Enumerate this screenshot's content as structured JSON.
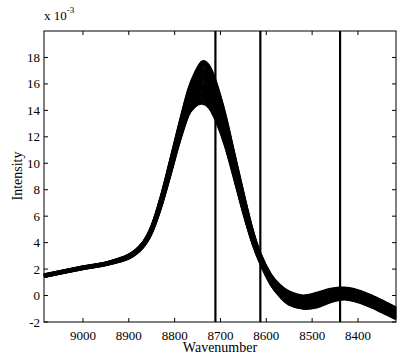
{
  "chart_data": {
    "type": "line",
    "title": "",
    "xlabel": "Wavenumber",
    "ylabel": "Intensity",
    "y_scale_label": "x 10",
    "y_scale_exponent": "-3",
    "xlim": [
      9085,
      8317
    ],
    "x_reversed": true,
    "ylim": [
      -2,
      20
    ],
    "grid": false,
    "legend": null,
    "x_ticks": [
      9000,
      8900,
      8800,
      8700,
      8600,
      8500,
      8400
    ],
    "y_ticks": [
      -2,
      0,
      2,
      4,
      6,
      8,
      10,
      12,
      14,
      16,
      18
    ],
    "vertical_lines": [
      8711,
      8613,
      8439
    ],
    "series": [
      {
        "name": "upper envelope",
        "x": [
          9085,
          9000,
          8950,
          8900,
          8870,
          8850,
          8830,
          8810,
          8790,
          8770,
          8755,
          8740,
          8725,
          8710,
          8690,
          8670,
          8650,
          8630,
          8613,
          8590,
          8570,
          8550,
          8520,
          8490,
          8460,
          8430,
          8400,
          8370,
          8340,
          8317
        ],
        "values": [
          1.6,
          2.2,
          2.5,
          3.1,
          4.0,
          5.3,
          7.5,
          10.2,
          13.0,
          15.6,
          16.9,
          17.7,
          17.4,
          16.2,
          13.8,
          10.8,
          7.8,
          5.0,
          3.2,
          1.6,
          0.8,
          0.3,
          0.0,
          0.2,
          0.5,
          0.6,
          0.4,
          0.0,
          -0.5,
          -0.9
        ]
      },
      {
        "name": "lower envelope",
        "x": [
          9085,
          9000,
          8950,
          8900,
          8870,
          8850,
          8830,
          8810,
          8790,
          8770,
          8755,
          8740,
          8725,
          8710,
          8690,
          8670,
          8650,
          8630,
          8613,
          8590,
          8570,
          8550,
          8520,
          8490,
          8460,
          8430,
          8400,
          8370,
          8340,
          8317
        ],
        "values": [
          1.4,
          2.0,
          2.3,
          2.8,
          3.6,
          4.7,
          6.6,
          9.0,
          11.5,
          13.6,
          14.3,
          14.5,
          14.2,
          13.2,
          11.3,
          8.8,
          6.2,
          3.9,
          2.4,
          0.8,
          -0.1,
          -0.7,
          -1.0,
          -0.9,
          -0.5,
          -0.3,
          -0.5,
          -0.9,
          -1.4,
          -1.8
        ]
      }
    ]
  }
}
